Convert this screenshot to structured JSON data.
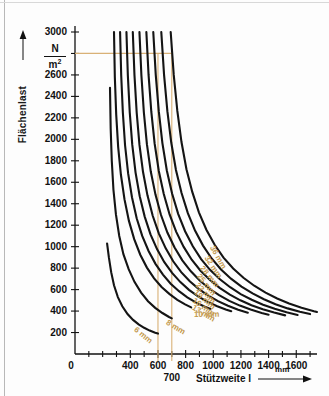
{
  "figure": {
    "background": "#fdfdfd",
    "curve_color": "#141414",
    "guide_color": "#d9b176",
    "label_color": "#c49a4e"
  },
  "axes": {
    "y": {
      "title": "Flächenlast",
      "unit_numerator": "N",
      "unit_denominator": "m",
      "unit_exponent": "2",
      "min": 0,
      "max": 3000,
      "tick_step": 200,
      "ticks": [
        200,
        400,
        600,
        800,
        1000,
        1200,
        1400,
        1600,
        1800,
        2000,
        2200,
        2400,
        2600,
        3000
      ],
      "tick_labels": [
        "200",
        "400",
        "600",
        "800",
        "1000",
        "1200",
        "1400",
        "1600",
        "1800",
        "2000",
        "2200",
        "2400",
        "2600",
        "3000"
      ],
      "hidden_tick_value": 2800,
      "arrow": "up-arrow"
    },
    "x": {
      "title": "Stützweite l",
      "unit": "mm",
      "origin_label": "0",
      "min": 0,
      "max": 1750,
      "minor_step": 100,
      "ticks": [
        400,
        600,
        800,
        1000,
        1200,
        1400,
        1600
      ],
      "tick_labels": [
        "400",
        "600",
        "800",
        "1000",
        "1200",
        "1400",
        "1600"
      ],
      "arrow": "right-arrow"
    }
  },
  "guides": {
    "horizontal": {
      "value": 2800,
      "label": ""
    },
    "vertical": [
      {
        "value": 600,
        "label": ""
      },
      {
        "value": 700,
        "label": "700"
      }
    ],
    "callout_label": "700"
  },
  "chart_data": {
    "type": "line",
    "title": "",
    "xlabel": "Stützweite l",
    "ylabel": "Flächenlast",
    "x_unit": "mm",
    "y_unit": "N/m2",
    "xlim": [
      0,
      1750
    ],
    "ylim": [
      0,
      3000
    ],
    "grid": false,
    "legend": "inline-curve-labels",
    "legend_position": "along-curves",
    "series": [
      {
        "name": "6 mm",
        "label": "6 mm",
        "thickness_mm": 6,
        "points": [
          [
            232,
            1030
          ],
          [
            245,
            900
          ],
          [
            262,
            760
          ],
          [
            282,
            640
          ],
          [
            310,
            530
          ],
          [
            342,
            445
          ],
          [
            380,
            372
          ],
          [
            420,
            318
          ],
          [
            460,
            276
          ],
          [
            500,
            244
          ],
          [
            540,
            218
          ],
          [
            580,
            198
          ],
          [
            600,
            190
          ]
        ]
      },
      {
        "name": "8 mm",
        "label": "8 mm",
        "thickness_mm": 8,
        "points": [
          [
            253,
            2480
          ],
          [
            258,
            2100
          ],
          [
            266,
            1800
          ],
          [
            278,
            1530
          ],
          [
            296,
            1300
          ],
          [
            320,
            1100
          ],
          [
            350,
            930
          ],
          [
            388,
            790
          ],
          [
            430,
            672
          ],
          [
            478,
            572
          ],
          [
            528,
            492
          ],
          [
            580,
            430
          ],
          [
            632,
            382
          ],
          [
            680,
            345
          ],
          [
            700,
            332
          ]
        ]
      },
      {
        "name": "10 mm",
        "label": "10 mm",
        "thickness_mm": 10,
        "points": [
          [
            282,
            3000
          ],
          [
            288,
            2580
          ],
          [
            298,
            2230
          ],
          [
            312,
            1930
          ],
          [
            332,
            1670
          ],
          [
            358,
            1440
          ],
          [
            390,
            1240
          ],
          [
            428,
            1070
          ],
          [
            472,
            925
          ],
          [
            520,
            805
          ],
          [
            572,
            705
          ],
          [
            626,
            625
          ],
          [
            682,
            560
          ],
          [
            740,
            505
          ],
          [
            796,
            462
          ],
          [
            840,
            434
          ]
        ]
      },
      {
        "name": "13 mm",
        "label": "13 mm",
        "thickness_mm": 13,
        "points": [
          [
            326,
            3000
          ],
          [
            334,
            2600
          ],
          [
            346,
            2250
          ],
          [
            362,
            1945
          ],
          [
            384,
            1685
          ],
          [
            412,
            1460
          ],
          [
            446,
            1265
          ],
          [
            486,
            1100
          ],
          [
            532,
            960
          ],
          [
            582,
            840
          ],
          [
            636,
            740
          ],
          [
            692,
            655
          ],
          [
            752,
            585
          ],
          [
            812,
            527
          ],
          [
            876,
            478
          ],
          [
            940,
            440
          ],
          [
            980,
            420
          ]
        ]
      },
      {
        "name": "16 mm",
        "label": "16 mm",
        "thickness_mm": 16,
        "points": [
          [
            372,
            3000
          ],
          [
            382,
            2600
          ],
          [
            396,
            2250
          ],
          [
            414,
            1950
          ],
          [
            438,
            1690
          ],
          [
            468,
            1470
          ],
          [
            504,
            1280
          ],
          [
            546,
            1115
          ],
          [
            594,
            975
          ],
          [
            646,
            855
          ],
          [
            702,
            755
          ],
          [
            762,
            670
          ],
          [
            824,
            598
          ],
          [
            890,
            537
          ],
          [
            956,
            488
          ],
          [
            1024,
            447
          ],
          [
            1090,
            415
          ],
          [
            1130,
            398
          ]
        ]
      },
      {
        "name": "19 mm",
        "label": "19 mm",
        "thickness_mm": 19,
        "points": [
          [
            418,
            3000
          ],
          [
            430,
            2600
          ],
          [
            446,
            2250
          ],
          [
            466,
            1950
          ],
          [
            492,
            1695
          ],
          [
            524,
            1478
          ],
          [
            562,
            1288
          ],
          [
            606,
            1124
          ],
          [
            656,
            984
          ],
          [
            710,
            864
          ],
          [
            768,
            763
          ],
          [
            830,
            678
          ],
          [
            896,
            605
          ],
          [
            964,
            543
          ],
          [
            1034,
            492
          ],
          [
            1106,
            449
          ],
          [
            1180,
            412
          ],
          [
            1250,
            384
          ]
        ]
      },
      {
        "name": "22 mm",
        "label": "22 mm",
        "thickness_mm": 22,
        "points": [
          [
            466,
            3000
          ],
          [
            480,
            2600
          ],
          [
            498,
            2250
          ],
          [
            520,
            1955
          ],
          [
            548,
            1700
          ],
          [
            582,
            1485
          ],
          [
            622,
            1295
          ],
          [
            668,
            1132
          ],
          [
            720,
            992
          ],
          [
            776,
            872
          ],
          [
            838,
            770
          ],
          [
            902,
            684
          ],
          [
            970,
            610
          ],
          [
            1042,
            548
          ],
          [
            1116,
            495
          ],
          [
            1192,
            451
          ],
          [
            1270,
            414
          ],
          [
            1350,
            382
          ],
          [
            1400,
            366
          ]
        ]
      },
      {
        "name": "25 mm",
        "label": "25 mm",
        "thickness_mm": 25,
        "points": [
          [
            516,
            3000
          ],
          [
            532,
            2600
          ],
          [
            552,
            2255
          ],
          [
            576,
            1960
          ],
          [
            606,
            1705
          ],
          [
            642,
            1490
          ],
          [
            684,
            1300
          ],
          [
            732,
            1138
          ],
          [
            786,
            998
          ],
          [
            844,
            878
          ],
          [
            908,
            776
          ],
          [
            976,
            690
          ],
          [
            1046,
            616
          ],
          [
            1120,
            553
          ],
          [
            1196,
            500
          ],
          [
            1276,
            455
          ],
          [
            1358,
            418
          ],
          [
            1440,
            386
          ],
          [
            1520,
            360
          ]
        ]
      },
      {
        "name": "28 mm",
        "label": "28 mm",
        "thickness_mm": 28,
        "points": [
          [
            566,
            3000
          ],
          [
            584,
            2600
          ],
          [
            606,
            2260
          ],
          [
            632,
            1965
          ],
          [
            664,
            1710
          ],
          [
            702,
            1496
          ],
          [
            746,
            1306
          ],
          [
            796,
            1144
          ],
          [
            852,
            1004
          ],
          [
            912,
            884
          ],
          [
            978,
            782
          ],
          [
            1048,
            696
          ],
          [
            1122,
            622
          ],
          [
            1198,
            558
          ],
          [
            1278,
            505
          ],
          [
            1360,
            459
          ],
          [
            1444,
            421
          ],
          [
            1530,
            389
          ],
          [
            1610,
            364
          ]
        ]
      },
      {
        "name": "32 mm",
        "label": "32 mm",
        "thickness_mm": 32,
        "points": [
          [
            624,
            3000
          ],
          [
            644,
            2600
          ],
          [
            668,
            2262
          ],
          [
            696,
            1970
          ],
          [
            730,
            1715
          ],
          [
            770,
            1502
          ],
          [
            816,
            1312
          ],
          [
            868,
            1150
          ],
          [
            926,
            1010
          ],
          [
            988,
            890
          ],
          [
            1056,
            788
          ],
          [
            1128,
            702
          ],
          [
            1204,
            628
          ],
          [
            1284,
            564
          ],
          [
            1366,
            510
          ],
          [
            1450,
            464
          ],
          [
            1538,
            425
          ],
          [
            1626,
            393
          ],
          [
            1700,
            372
          ]
        ]
      },
      {
        "name": "36 mm",
        "label": "36 mm",
        "thickness_mm": 36,
        "points": [
          [
            692,
            3000
          ],
          [
            714,
            2600
          ],
          [
            740,
            2265
          ],
          [
            770,
            1975
          ],
          [
            806,
            1722
          ],
          [
            848,
            1510
          ],
          [
            896,
            1320
          ],
          [
            950,
            1158
          ],
          [
            1010,
            1018
          ],
          [
            1074,
            898
          ],
          [
            1144,
            796
          ],
          [
            1218,
            710
          ],
          [
            1296,
            636
          ],
          [
            1378,
            572
          ],
          [
            1462,
            517
          ],
          [
            1548,
            470
          ],
          [
            1638,
            431
          ],
          [
            1728,
            398
          ],
          [
            1750,
            391
          ]
        ]
      }
    ]
  }
}
